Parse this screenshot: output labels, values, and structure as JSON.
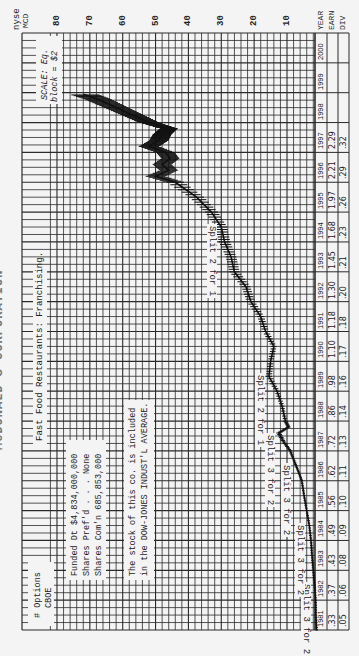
{
  "header": {
    "exchange": "nyse",
    "ticker": "MCD",
    "title": "McDONALD'S CORPORATION",
    "scale_note_line1": "SCALE: Eq.",
    "scale_note_line2": "block = $2"
  },
  "annotations": {
    "industry": "Fast Food Restaurants: Franchising.",
    "capitalization": {
      "line1": "Funded Dt $4,834,000,000",
      "line2": "Shares Pref'd . . . None",
      "line3": "Shares Com'n 685,853,000"
    },
    "index_note": {
      "line1": "The stock of this co. is included",
      "line2": "in the DOW-JONES INDUST'L AVERAGE."
    },
    "options": {
      "line1": "# Options",
      "line2": "CBOE"
    },
    "splits": [
      {
        "label": "Split 3 for 2",
        "year": 1982
      },
      {
        "label": "Split 3 for 2",
        "year": 1984
      },
      {
        "label": "Split 3 for 2",
        "year": 1986
      },
      {
        "label": "Split 3 for 2",
        "year": 1987
      },
      {
        "label": "Split 2 for 1",
        "year": 1989
      },
      {
        "label": "Split 2 for 1",
        "year": 1994
      }
    ]
  },
  "table": {
    "row_labels": [
      "YEAR",
      "EARN",
      "DIV"
    ],
    "years": [
      "1981",
      "1982",
      "1983",
      "1984",
      "1985",
      "1986",
      "1987",
      "1988",
      "1989",
      "1990",
      "1991",
      "1992",
      "1993",
      "1994",
      "1995",
      "1996",
      "1997",
      "1998",
      "1999",
      "2000"
    ],
    "earnings": [
      ".33",
      ".37",
      ".43",
      ".49",
      ".56",
      ".62",
      ".72",
      ".86",
      ".98",
      "1.10",
      "1.18",
      "1.30",
      "1.45",
      "1.68",
      "1.97",
      "2.21",
      "2.29",
      "",
      "",
      ""
    ],
    "dividends": [
      ".05",
      ".06",
      ".08",
      ".09",
      ".10",
      ".11",
      ".13",
      ".14",
      ".16",
      ".17",
      ".18",
      ".20",
      ".21",
      ".23",
      ".26",
      ".29",
      ".32",
      "",
      "",
      ""
    ]
  },
  "chart_data": {
    "type": "line",
    "xlabel": "Year",
    "ylabel": "Price ($)",
    "orientation": "rotated 90deg (price axis horizontal at top, years vertical, 1981 at bottom)",
    "price_ticks": [
      80,
      70,
      60,
      50,
      40,
      30,
      20,
      10
    ],
    "ylim": [
      0,
      82
    ],
    "grid": true,
    "scale": "Equal, block = $2",
    "x": [
      1981.0,
      1981.5,
      1982.0,
      1982.5,
      1983.0,
      1983.5,
      1984.0,
      1984.5,
      1985.0,
      1985.5,
      1986.0,
      1986.3,
      1986.6,
      1987.0,
      1987.3,
      1987.6,
      1987.8,
      1988.0,
      1988.5,
      1989.0,
      1989.5,
      1990.0,
      1990.5,
      1991.0,
      1991.5,
      1992.0,
      1992.5,
      1993.0,
      1993.5,
      1994.0,
      1994.5,
      1995.0,
      1995.5,
      1996.0,
      1996.2,
      1996.4,
      1996.6,
      1996.8,
      1997.0,
      1997.2,
      1997.4,
      1997.6,
      1997.8,
      1998.0,
      1998.2,
      1998.4,
      1998.6,
      1998.8,
      1998.95
    ],
    "values": [
      1.0,
      1.2,
      1.3,
      1.6,
      2.0,
      2.4,
      2.7,
      3.2,
      4.0,
      4.8,
      5.5,
      6.5,
      7.6,
      9.0,
      11.0,
      12.5,
      9.5,
      10.5,
      11.5,
      13.0,
      15.5,
      15.0,
      14.0,
      16.5,
      18.0,
      21.0,
      22.5,
      26.0,
      27.0,
      29.0,
      30.0,
      33.0,
      37.5,
      44.0,
      50.0,
      46.0,
      48.0,
      45.5,
      47.0,
      52.0,
      49.0,
      48.0,
      46.0,
      52.0,
      56.0,
      60.0,
      64.0,
      68.0,
      72.0
    ],
    "series": [
      {
        "name": "Monthly price range",
        "values_ref": "values"
      }
    ]
  }
}
